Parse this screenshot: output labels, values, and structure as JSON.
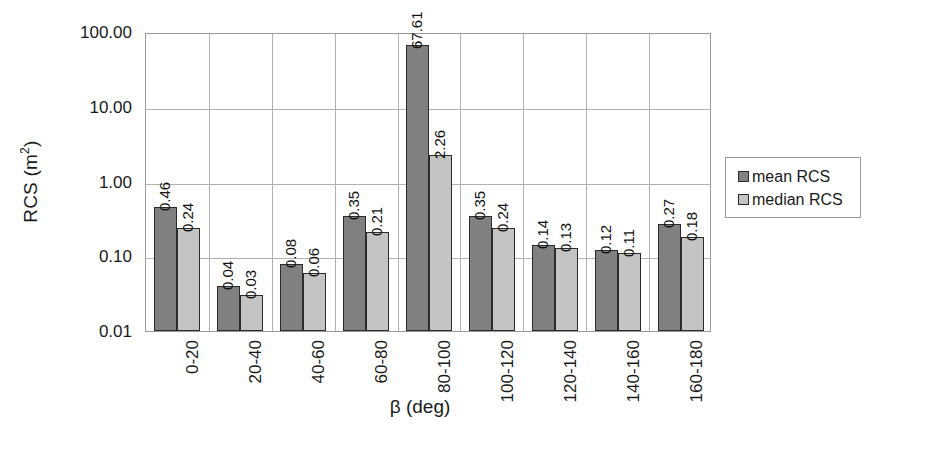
{
  "chart_data": {
    "type": "bar",
    "title": "",
    "xlabel": "β (deg)",
    "ylabel": "RCS (m²)",
    "ylabel_base": "RCS (m",
    "ylabel_sup": "2",
    "ylabel_tail": ")",
    "yscale": "log",
    "ylim": [
      0.01,
      100
    ],
    "ytick_labels": [
      "100.00",
      "10.00",
      "1.00",
      "0.10",
      "0.01"
    ],
    "ytick_values": [
      100,
      10,
      1,
      0.1,
      0.01
    ],
    "grid": true,
    "legend_position": "right",
    "categories": [
      "0-20",
      "20-40",
      "40-60",
      "60-80",
      "80-100",
      "100-120",
      "120-140",
      "140-160",
      "160-180"
    ],
    "series": [
      {
        "name": "mean RCS",
        "color": "#808080",
        "values": [
          0.46,
          0.04,
          0.08,
          0.35,
          67.61,
          0.35,
          0.14,
          0.12,
          0.27
        ],
        "labels": [
          "0.46",
          "0.04",
          "0.08",
          "0.35",
          "67.61",
          "0.35",
          "0.14",
          "0.12",
          "0.27"
        ]
      },
      {
        "name": "median RCS",
        "color": "#c4c4c4",
        "values": [
          0.24,
          0.03,
          0.06,
          0.21,
          2.26,
          0.24,
          0.13,
          0.11,
          0.18
        ],
        "labels": [
          "0.24",
          "0.03",
          "0.06",
          "0.21",
          "2.26",
          "0.24",
          "0.13",
          "0.11",
          "0.18"
        ]
      }
    ]
  },
  "legend": {
    "items": [
      {
        "label": "mean RCS",
        "color": "#808080"
      },
      {
        "label": "median RCS",
        "color": "#c4c4c4"
      }
    ]
  }
}
